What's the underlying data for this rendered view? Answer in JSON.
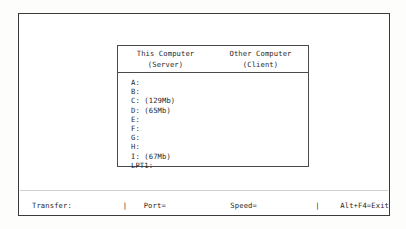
{
  "screen": {
    "panel": {
      "columns": [
        {
          "title": "This Computer",
          "subtitle": "(Server)"
        },
        {
          "title": "Other Computer",
          "subtitle": "(Client)"
        }
      ],
      "rows": [
        {
          "this_computer": "A:",
          "other_computer": ""
        },
        {
          "this_computer": "B:",
          "other_computer": ""
        },
        {
          "this_computer": "C: (129Mb)",
          "other_computer": ""
        },
        {
          "this_computer": "D: (65Mb)",
          "other_computer": ""
        },
        {
          "this_computer": "E:",
          "other_computer": ""
        },
        {
          "this_computer": "F:",
          "other_computer": ""
        },
        {
          "this_computer": "G:",
          "other_computer": ""
        },
        {
          "this_computer": "H:",
          "other_computer": ""
        },
        {
          "this_computer": "I: (67Mb)",
          "other_computer": ""
        },
        {
          "this_computer": "LPT1:",
          "other_computer": ""
        }
      ]
    },
    "status_bar": {
      "transfer_label": "Transfer:",
      "separator": "|",
      "port_label": "Port=",
      "speed_label": "Speed=",
      "exit_hint": "Alt+F4=Exit"
    }
  },
  "colors": {
    "frame_border": "#3b3b3b",
    "panel_border": "#4a4a4a",
    "text": "#1f1f1f",
    "background": "#ffffff"
  }
}
